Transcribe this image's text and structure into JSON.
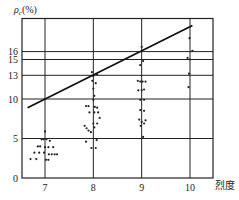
{
  "chart_data": {
    "type": "scatter",
    "title": "",
    "xlabel": "烈度",
    "ylabel": "ρc(%)",
    "ylabel_symbol": "ρ",
    "ylabel_subscript": "c",
    "ylabel_unit": "(%)",
    "x_ticks": [
      7,
      8,
      9,
      10
    ],
    "y_ticks": [
      0,
      5,
      10,
      13,
      15,
      16
    ],
    "xlim": [
      6.5,
      10.5
    ],
    "ylim": [
      0,
      20
    ],
    "grid": true,
    "legend": null,
    "series": [
      {
        "name": "observations",
        "kind": "points",
        "points": [
          [
            7.0,
            5.9
          ],
          [
            6.93,
            4.9
          ],
          [
            6.97,
            4.9
          ],
          [
            7.03,
            4.9
          ],
          [
            7.1,
            4.7
          ],
          [
            6.85,
            4.0
          ],
          [
            6.9,
            4.0
          ],
          [
            7.0,
            3.9
          ],
          [
            7.07,
            3.9
          ],
          [
            7.17,
            3.9
          ],
          [
            6.78,
            3.2
          ],
          [
            6.88,
            3.2
          ],
          [
            6.98,
            3.2
          ],
          [
            7.08,
            3.0
          ],
          [
            7.14,
            3.0
          ],
          [
            7.2,
            3.0
          ],
          [
            7.25,
            3.0
          ],
          [
            6.7,
            2.4
          ],
          [
            6.82,
            2.4
          ],
          [
            7.02,
            2.3
          ],
          [
            7.07,
            2.3
          ],
          [
            7.97,
            13.4
          ],
          [
            8.08,
            13.1
          ],
          [
            8.0,
            12.9
          ],
          [
            7.98,
            12.3
          ],
          [
            8.05,
            12.0
          ],
          [
            8.0,
            11.3
          ],
          [
            8.02,
            10.4
          ],
          [
            8.0,
            9.9
          ],
          [
            7.85,
            9.1
          ],
          [
            7.9,
            9.1
          ],
          [
            8.03,
            9.0
          ],
          [
            8.08,
            8.9
          ],
          [
            7.92,
            8.3
          ],
          [
            8.02,
            8.3
          ],
          [
            8.1,
            8.3
          ],
          [
            8.13,
            7.6
          ],
          [
            8.0,
            6.9
          ],
          [
            8.08,
            6.9
          ],
          [
            7.82,
            6.6
          ],
          [
            7.86,
            6.3
          ],
          [
            7.9,
            6.0
          ],
          [
            7.95,
            5.8
          ],
          [
            8.02,
            6.4
          ],
          [
            7.85,
            4.6
          ],
          [
            8.07,
            4.8
          ],
          [
            7.96,
            3.8
          ],
          [
            8.05,
            3.8
          ],
          [
            9.0,
            16.6
          ],
          [
            9.03,
            14.8
          ],
          [
            8.97,
            14.3
          ],
          [
            8.92,
            12.3
          ],
          [
            8.97,
            12.2
          ],
          [
            9.02,
            12.2
          ],
          [
            9.08,
            12.2
          ],
          [
            8.93,
            11.1
          ],
          [
            9.0,
            11.1
          ],
          [
            9.05,
            11.2
          ],
          [
            8.97,
            9.9
          ],
          [
            9.05,
            9.9
          ],
          [
            8.97,
            8.6
          ],
          [
            9.05,
            8.5
          ],
          [
            8.95,
            7.4
          ],
          [
            9.08,
            7.3
          ],
          [
            9.0,
            7.1
          ],
          [
            9.05,
            6.9
          ],
          [
            8.98,
            6.6
          ],
          [
            9.03,
            5.2
          ],
          [
            9.99,
            17.7
          ],
          [
            10.05,
            16.1
          ],
          [
            9.95,
            15.2
          ],
          [
            10.0,
            15.0
          ],
          [
            9.98,
            13.2
          ],
          [
            9.97,
            11.5
          ]
        ]
      },
      {
        "name": "regression",
        "kind": "line",
        "points": [
          [
            6.64,
            8.9
          ],
          [
            10.05,
            19.3
          ]
        ]
      }
    ]
  }
}
